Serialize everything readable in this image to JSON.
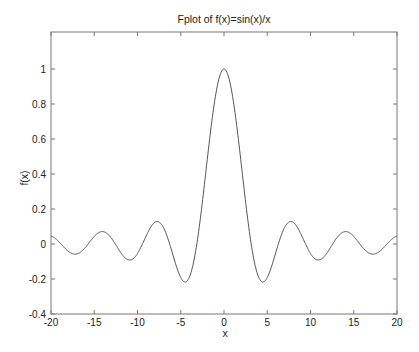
{
  "chart_data": {
    "type": "line",
    "title": "Fplot of f(x)=sin(x)/x",
    "xlabel": "x",
    "ylabel": "f(x)",
    "xlim": [
      -20,
      20
    ],
    "ylim": [
      -0.4,
      1.2
    ],
    "grid": false,
    "legend": null,
    "x_ticks": [
      -20,
      -15,
      -10,
      -5,
      0,
      5,
      10,
      15,
      20
    ],
    "x_tick_labels": [
      "-20",
      "-15",
      "-10",
      "-5",
      "0",
      "5",
      "10",
      "15",
      "20"
    ],
    "y_ticks": [
      -0.4,
      -0.2,
      0,
      0.2,
      0.4,
      0.6,
      0.8,
      1
    ],
    "y_tick_labels": [
      "-0.4",
      "-0.2",
      "0",
      "0.2",
      "0.4",
      "0.6",
      "0.8",
      "1"
    ],
    "series": [
      {
        "name": "sin(x)/x",
        "color": "#555555",
        "function": "sin(x)/x",
        "x": [
          -20,
          -19.5,
          -19,
          -18.5,
          -18,
          -17.5,
          -17,
          -16.5,
          -16,
          -15.5,
          -15,
          -14.5,
          -14,
          -13.5,
          -13,
          -12.5,
          -12,
          -11.5,
          -11,
          -10.5,
          -10,
          -9.5,
          -9,
          -8.5,
          -8,
          -7.5,
          -7,
          -6.5,
          -6,
          -5.5,
          -5,
          -4.5,
          -4,
          -3.5,
          -3,
          -2.5,
          -2,
          -1.5,
          -1,
          -0.5,
          0,
          0.5,
          1,
          1.5,
          2,
          2.5,
          3,
          3.5,
          4,
          4.5,
          5,
          5.5,
          6,
          6.5,
          7,
          7.5,
          8,
          8.5,
          9,
          9.5,
          10,
          10.5,
          11,
          11.5,
          12,
          12.5,
          13,
          13.5,
          14,
          14.5,
          15,
          15.5,
          16,
          16.5,
          17,
          17.5,
          18,
          18.5,
          19,
          19.5,
          20
        ],
        "y": [
          0.0456,
          0.0311,
          0.0079,
          -0.0179,
          -0.0417,
          -0.0559,
          -0.0566,
          -0.0432,
          -0.018,
          0.0127,
          0.0433,
          0.0643,
          0.0707,
          0.0593,
          0.0323,
          -0.0053,
          -0.0447,
          -0.0761,
          -0.0909,
          -0.0839,
          -0.0544,
          -0.0786,
          0.0458,
          0.0939,
          0.1237,
          0.125,
          0.0939,
          0.0331,
          -0.0466,
          -0.1282,
          -0.1918,
          -0.2172,
          -0.1892,
          -0.1002,
          0.047,
          0.2394,
          0.4546,
          0.665,
          0.8415,
          0.9589,
          1.0,
          0.9589,
          0.8415,
          0.665,
          0.4546,
          0.2394,
          0.047,
          -0.1002,
          -0.1892,
          -0.2172,
          -0.1918,
          -0.1282,
          -0.0466,
          0.0331,
          0.0939,
          0.125,
          0.1237,
          0.0939,
          0.0458,
          -0.0079,
          -0.0544,
          -0.0839,
          -0.0909,
          -0.0761,
          -0.0447,
          -0.0053,
          0.0323,
          0.0593,
          0.0707,
          0.0643,
          0.0433,
          0.0127,
          -0.018,
          -0.0432,
          -0.0566,
          -0.0559,
          -0.0417,
          -0.0179,
          0.0079,
          0.0311,
          0.0456
        ]
      }
    ]
  }
}
